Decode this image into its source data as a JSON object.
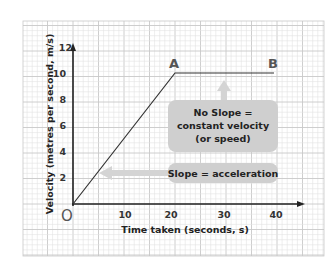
{
  "chart_data": {
    "type": "line",
    "title": "",
    "xlabel": "Time taken (seconds, s)",
    "ylabel": "Velocity (metres per second, m/s)",
    "x_ticks": [
      "10",
      "20",
      "30",
      "40"
    ],
    "y_ticks": [
      "2",
      "4",
      "6",
      "8",
      "10",
      "12"
    ],
    "xlim": [
      0,
      45
    ],
    "ylim": [
      0,
      12
    ],
    "grid": true,
    "origin_label": "O",
    "series": [
      {
        "name": "velocity",
        "x": [
          0,
          20,
          40
        ],
        "y": [
          0,
          10,
          10
        ]
      }
    ],
    "points": [
      {
        "label": "A",
        "x": 20,
        "y": 10
      },
      {
        "label": "B",
        "x": 40,
        "y": 10
      }
    ],
    "annotations": [
      {
        "text": [
          "No Slope =",
          "constant velocity",
          "(or speed)"
        ],
        "points_to": "segment AB"
      },
      {
        "text": [
          "Slope = acceleration"
        ],
        "points_to": "segment OA"
      }
    ]
  },
  "colors": {
    "axis": "#222222",
    "grid_minor": "#e2e2e2",
    "grid_major": "#c8c8c8",
    "annotation_box": "#cfcfcf",
    "arrow": "#d4d4d4"
  }
}
